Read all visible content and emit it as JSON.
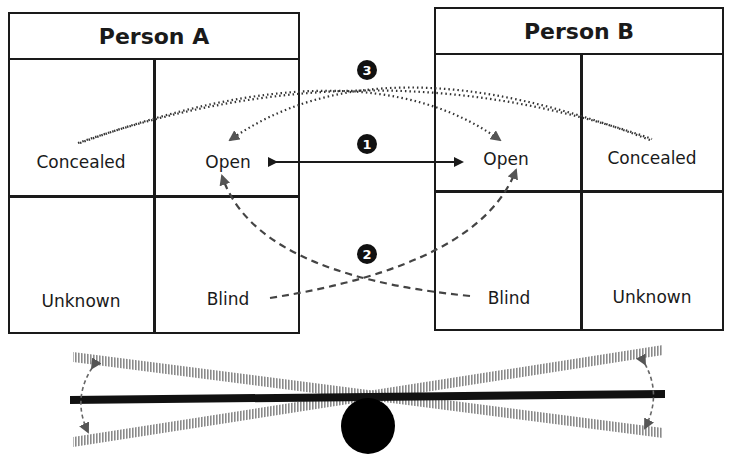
{
  "person_a": {
    "title": "Person A",
    "quadrants": {
      "top_left": "Concealed",
      "top_right": "Open",
      "bottom_left": "Unknown",
      "bottom_right": "Blind"
    }
  },
  "person_b": {
    "title": "Person B",
    "quadrants": {
      "top_left": "Open",
      "top_right": "Concealed",
      "bottom_left": "Blind",
      "bottom_right": "Unknown"
    }
  },
  "connections": [
    {
      "badge": "1",
      "from": "Person A Open",
      "to": "Person B Open",
      "style": "solid double-headed arrow"
    },
    {
      "badge": "2",
      "from": "Blind",
      "to": "Open (other person)",
      "style": "dashed crossing arrows"
    },
    {
      "badge": "3",
      "from": "Concealed",
      "to": "Open (other person)",
      "style": "dotted crossing arrows"
    }
  ],
  "seesaw": {
    "description": "balance beam on circular fulcrum with tilt range shown by hatched beams and curved arrows",
    "colors": {
      "beam": "#111111",
      "hatched": "#8a8a8a",
      "arrow": "#666666"
    }
  },
  "colors": {
    "line": "#1a1a1a",
    "text": "#1a1a1a",
    "background": "#ffffff"
  }
}
